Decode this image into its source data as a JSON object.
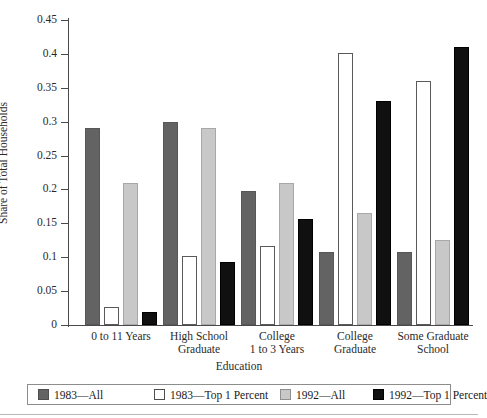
{
  "chart_data": {
    "type": "bar",
    "title": "",
    "xlabel": "Education",
    "ylabel": "Share of Total Households",
    "ylim": [
      0,
      0.45
    ],
    "yticks": [
      0,
      0.05,
      0.1,
      0.15,
      0.2,
      0.25,
      0.3,
      0.35,
      0.4,
      0.45
    ],
    "ytick_labels": [
      "0",
      "0.05",
      "0.1",
      "0.15",
      "0.2",
      "0.25",
      "0.3",
      "0.35",
      "0.4",
      "0.45"
    ],
    "grid": false,
    "legend_position": "bottom",
    "categories": [
      "0 to 11 Years",
      "High School Graduate",
      "College 1 to 3 Years",
      "College Graduate",
      "Some Graduate School"
    ],
    "category_lines": [
      [
        "0 to 11 Years"
      ],
      [
        "High School",
        "Graduate"
      ],
      [
        "College",
        "1 to 3 Years"
      ],
      [
        "College",
        "Graduate"
      ],
      [
        "Some Graduate",
        "School"
      ]
    ],
    "series": [
      {
        "name": "1983—All",
        "color": "#636363",
        "values": [
          0.29,
          0.3,
          0.197,
          0.107,
          0.107
        ]
      },
      {
        "name": "1983—Top 1 Percent",
        "color": "#ffffff",
        "values": [
          0.027,
          0.102,
          0.117,
          0.401,
          0.36
        ]
      },
      {
        "name": "1992—All",
        "color": "#c8c8c8",
        "values": [
          0.21,
          0.29,
          0.21,
          0.165,
          0.125
        ]
      },
      {
        "name": "1992—Top 1 Percent",
        "color": "#101010",
        "values": [
          0.019,
          0.093,
          0.157,
          0.33,
          0.41
        ]
      }
    ]
  }
}
